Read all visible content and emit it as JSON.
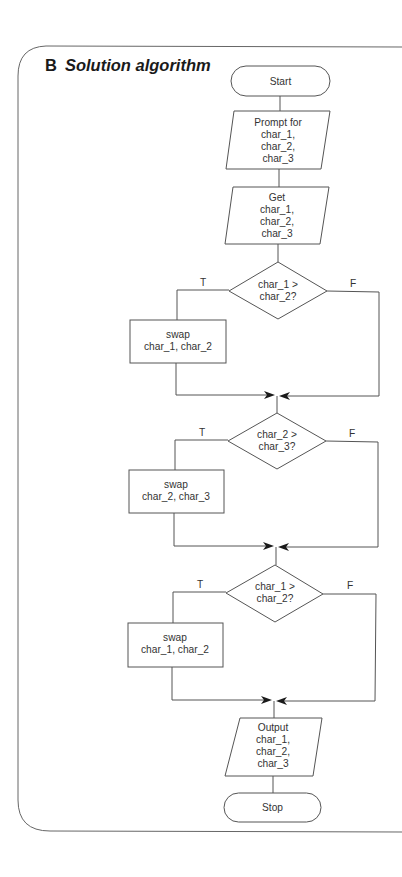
{
  "section": {
    "letter": "B",
    "title": "Solution algorithm"
  },
  "flowchart": {
    "start": "Start",
    "prompt": [
      "Prompt for",
      "char_1,",
      "char_2,",
      "char_3"
    ],
    "get": [
      "Get",
      "char_1,",
      "char_2,",
      "char_3"
    ],
    "decisions": [
      {
        "line1": "char_1 >",
        "line2": "char_2?",
        "true_label": "T",
        "false_label": "F",
        "action": [
          "swap",
          "char_1, char_2"
        ]
      },
      {
        "line1": "char_2 >",
        "line2": "char_3?",
        "true_label": "T",
        "false_label": "F",
        "action": [
          "swap",
          "char_2, char_3"
        ]
      },
      {
        "line1": "char_1 >",
        "line2": "char_2?",
        "true_label": "T",
        "false_label": "F",
        "action": [
          "swap",
          "char_1, char_2"
        ]
      }
    ],
    "output": [
      "Output",
      "char_1,",
      "char_2,",
      "char_3"
    ],
    "stop": "Stop"
  },
  "colors": {
    "stroke": "#555555",
    "text": "#333333",
    "background": "#ffffff"
  }
}
